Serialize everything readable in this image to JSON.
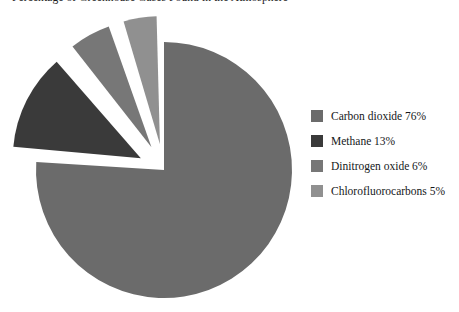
{
  "chart_data": {
    "type": "pie",
    "title": "Percentage of Greenhouse Gases Found in the Atmosphere",
    "xlabel": "",
    "ylabel": "",
    "legend_position": "right",
    "grid": false,
    "categories": [
      "Carbon dioxide",
      "Methane",
      "Dinitrogen oxide",
      "Chlorofluorocarbons"
    ],
    "values": [
      76,
      13,
      6,
      5
    ],
    "unit": "%",
    "slices": [
      {
        "label": "Carbon dioxide",
        "value": 76,
        "legend_text": "Carbon dioxide 76%",
        "color": "#6b6b6b",
        "exploded": false,
        "start_angle_deg": 0,
        "end_angle_deg": 273.6
      },
      {
        "label": "Methane",
        "value": 13,
        "legend_text": "Methane 13%",
        "color": "#3a3a3a",
        "exploded": true,
        "start_angle_deg": 273.6,
        "end_angle_deg": 320.4
      },
      {
        "label": "Dinitrogen oxide",
        "value": 6,
        "legend_text": "Dinitrogen oxide 6%",
        "color": "#777777",
        "exploded": true,
        "start_angle_deg": 320.4,
        "end_angle_deg": 342.0
      },
      {
        "label": "Chlorofluorocarbons",
        "value": 5,
        "legend_text": "Chlorofluorocarbons 5%",
        "color": "#909090",
        "exploded": true,
        "start_angle_deg": 342.0,
        "end_angle_deg": 360.0
      }
    ]
  },
  "legend": {
    "items": [
      {
        "label": "Carbon dioxide 76%",
        "color": "#6b6b6b"
      },
      {
        "label": "Methane 13%",
        "color": "#3a3a3a"
      },
      {
        "label": "Dinitrogen oxide 6%",
        "color": "#777777"
      },
      {
        "label": "Chlorofluorocarbons 5%",
        "color": "#909090"
      }
    ]
  },
  "background_color": "#ffffff"
}
